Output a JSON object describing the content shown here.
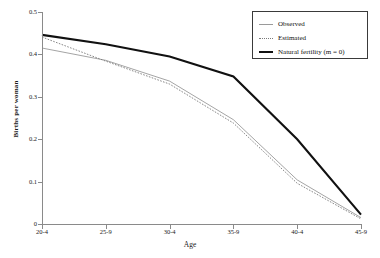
{
  "chart_data": {
    "type": "line",
    "title": "",
    "xlabel": "Age",
    "ylabel": "Births per woman",
    "categories": [
      "20-4",
      "25-9",
      "30-4",
      "35-9",
      "40-4",
      "45-9"
    ],
    "x": [
      0,
      1,
      2,
      3,
      4,
      5
    ],
    "xlim": [
      0,
      5
    ],
    "ylim": [
      0,
      0.5
    ],
    "yticks": [
      "0",
      "0.1",
      "0.2",
      "0.3",
      "0.4",
      "0.5"
    ],
    "ytick_values": [
      0,
      0.1,
      0.2,
      0.3,
      0.4,
      0.5
    ],
    "grid": false,
    "legend_position": "top-right",
    "series": [
      {
        "name": "Observed",
        "style": "thin-solid",
        "color": "#9a9a9a",
        "values": [
          0.415,
          0.386,
          0.337,
          0.246,
          0.104,
          0.015
        ]
      },
      {
        "name": "Estimated",
        "style": "dotted",
        "color": "#7a7a7a",
        "values": [
          0.441,
          0.384,
          0.33,
          0.238,
          0.096,
          0.012
        ]
      },
      {
        "name": "Natural fertility (m = 0)",
        "style": "thick-solid",
        "color": "#111111",
        "values": [
          0.446,
          0.424,
          0.395,
          0.348,
          0.2,
          0.022
        ]
      }
    ]
  },
  "axes": {
    "x_title": "Age",
    "y_title": "Births per woman",
    "x_tick_labels": [
      "20-4",
      "25-9",
      "30-4",
      "35-9",
      "40-4",
      "45-9"
    ],
    "y_tick_labels": [
      "0.5",
      "0.4",
      "0.3",
      "0.2",
      "0.1",
      "0"
    ]
  },
  "legend": {
    "items": [
      {
        "label": "Observed",
        "swatch": "thin-line-icon"
      },
      {
        "label": "Estimated",
        "swatch": "dotted-line-icon"
      },
      {
        "label": "Natural fertility (m = 0)",
        "swatch": "thick-line-icon"
      }
    ]
  },
  "colors": {
    "observed": "#9a9a9a",
    "estimated": "#7a7a7a",
    "natural": "#111111",
    "axis": "#8a8a8a",
    "background": "#ffffff"
  }
}
